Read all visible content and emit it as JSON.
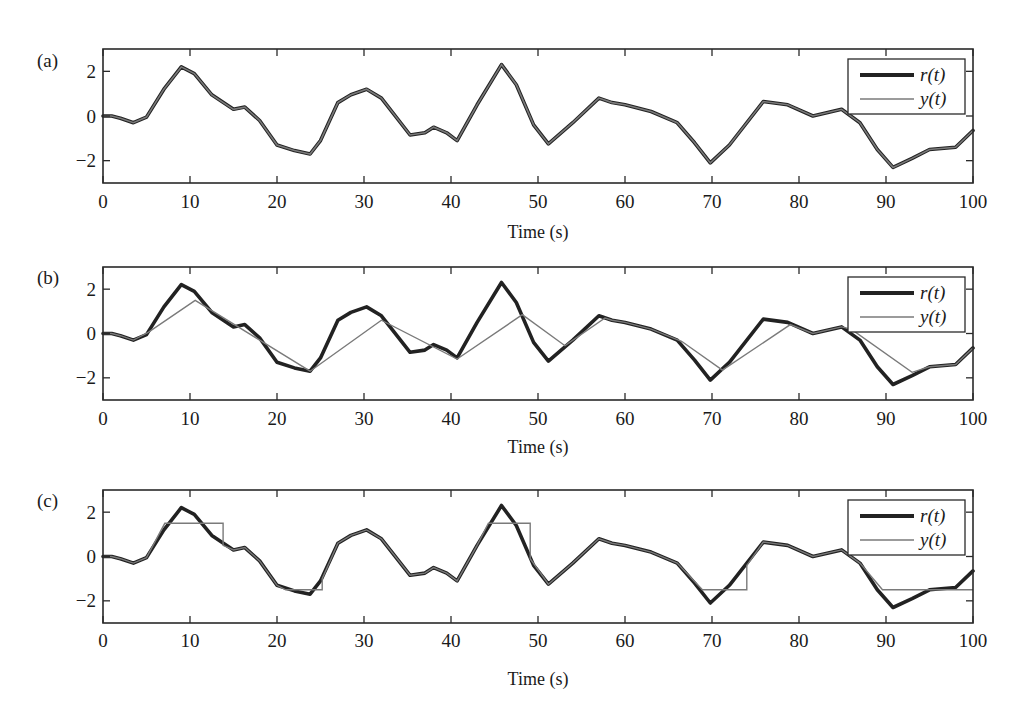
{
  "figure": {
    "background": "#ffffff",
    "axis_color": "#2a2a2a",
    "r_color": "#222222",
    "y_color": "#7a7a7a"
  },
  "chart_data": [
    {
      "type": "line",
      "panel_label": "(a)",
      "title": "",
      "xlabel": "Time (s)",
      "ylabel": "",
      "xlim": [
        0,
        100
      ],
      "ylim": [
        -3,
        3
      ],
      "xticks": [
        0,
        10,
        20,
        30,
        40,
        50,
        60,
        70,
        80,
        90,
        100
      ],
      "yticks": [
        2,
        0,
        -2
      ],
      "ytick_labels": [
        "2",
        "0",
        "−2"
      ],
      "grid": false,
      "legend": {
        "position": "upper right",
        "entries": [
          "r(t)",
          "y(t)"
        ]
      },
      "series": [
        {
          "name": "r(t)",
          "style": "thick dark",
          "x": [
            0,
            1,
            2,
            3.5,
            5,
            7,
            9,
            10.5,
            12.5,
            15,
            16.3,
            18,
            20,
            22,
            23.8,
            25,
            27,
            28.5,
            30.3,
            32,
            35.3,
            37,
            38,
            39.5,
            40.7,
            43,
            45.8,
            47.5,
            49.5,
            51.2,
            54,
            57,
            58.5,
            60,
            63,
            66,
            68,
            69.8,
            72,
            75.9,
            78.7,
            81.6,
            84.9,
            87,
            89,
            90.8,
            93,
            95,
            98,
            100
          ],
          "y": [
            0,
            0,
            -0.1,
            -0.3,
            -0.05,
            1.2,
            2.2,
            1.9,
            0.95,
            0.3,
            0.4,
            -0.2,
            -1.3,
            -1.55,
            -1.7,
            -1.1,
            0.6,
            0.95,
            1.2,
            0.8,
            -0.85,
            -0.75,
            -0.5,
            -0.75,
            -1.1,
            0.5,
            2.3,
            1.4,
            -0.4,
            -1.25,
            -0.3,
            0.8,
            0.6,
            0.5,
            0.2,
            -0.3,
            -1.2,
            -2.1,
            -1.3,
            0.65,
            0.5,
            0.0,
            0.3,
            -0.3,
            -1.5,
            -2.3,
            -1.9,
            -1.5,
            -1.4,
            -0.65
          ]
        },
        {
          "name": "y(t)",
          "style": "thin gray",
          "same_as": "r(t)"
        }
      ]
    },
    {
      "type": "line",
      "panel_label": "(b)",
      "title": "",
      "xlabel": "Time (s)",
      "ylabel": "",
      "xlim": [
        0,
        100
      ],
      "ylim": [
        -3,
        3
      ],
      "xticks": [
        0,
        10,
        20,
        30,
        40,
        50,
        60,
        70,
        80,
        90,
        100
      ],
      "yticks": [
        2,
        0,
        -2
      ],
      "ytick_labels": [
        "2",
        "0",
        "−2"
      ],
      "grid": false,
      "legend": {
        "position": "upper right",
        "entries": [
          "r(t)",
          "y(t)"
        ]
      },
      "series": [
        {
          "name": "r(t)",
          "style": "thick dark",
          "same_as_panel": "(a)"
        },
        {
          "name": "y(t)",
          "style": "thin gray (piecewise linear)",
          "x": [
            0,
            1,
            2,
            3.5,
            5.2,
            10.6,
            23.8,
            32,
            40.7,
            48.2,
            53.1,
            57.7,
            58.5,
            60,
            63,
            66.5,
            71.2,
            79,
            81.6,
            84.9,
            86,
            93,
            95,
            98,
            100
          ],
          "y": [
            0,
            0,
            -0.1,
            -0.3,
            0.05,
            1.5,
            -1.7,
            0.6,
            -1.15,
            0.85,
            -0.55,
            0.7,
            0.6,
            0.5,
            0.2,
            -0.35,
            -1.65,
            0.4,
            0.0,
            0.3,
            0.2,
            -1.75,
            -1.5,
            -1.4,
            -0.65
          ]
        }
      ]
    },
    {
      "type": "line",
      "panel_label": "(c)",
      "title": "",
      "xlabel": "Time (s)",
      "ylabel": "",
      "xlim": [
        0,
        100
      ],
      "ylim": [
        -3,
        3
      ],
      "xticks": [
        0,
        10,
        20,
        30,
        40,
        50,
        60,
        70,
        80,
        90,
        100
      ],
      "yticks": [
        2,
        0,
        -2
      ],
      "ytick_labels": [
        "2",
        "0",
        "−2"
      ],
      "grid": false,
      "legend": {
        "position": "upper right",
        "entries": [
          "r(t)",
          "y(t)"
        ]
      },
      "series": [
        {
          "name": "r(t)",
          "style": "thick dark",
          "same_as_panel": "(a)"
        },
        {
          "name": "y(t)",
          "style": "thin gray (saturated hold)",
          "x": [
            0,
            1,
            2,
            3.5,
            5,
            7.1,
            13.8,
            13.8,
            15,
            16.3,
            18,
            20,
            21,
            25.2,
            25.2,
            27,
            28.5,
            30.3,
            32,
            35.3,
            37,
            38,
            39.5,
            40.7,
            43,
            44.3,
            49.1,
            49.1,
            51.2,
            54,
            57,
            58.5,
            60,
            63,
            66,
            68.9,
            74,
            74,
            75.9,
            78.7,
            81.6,
            84.9,
            87,
            89.6,
            100
          ],
          "y": [
            0,
            0,
            -0.1,
            -0.3,
            -0.05,
            1.5,
            1.5,
            0.5,
            0.3,
            0.4,
            -0.2,
            -1.3,
            -1.5,
            -1.5,
            -1.0,
            0.6,
            0.95,
            1.2,
            0.8,
            -0.85,
            -0.75,
            -0.5,
            -0.75,
            -1.1,
            0.5,
            1.5,
            1.5,
            -0.1,
            -1.25,
            -0.3,
            0.8,
            0.6,
            0.5,
            0.2,
            -0.3,
            -1.5,
            -1.5,
            -0.4,
            0.65,
            0.5,
            0.0,
            0.3,
            -0.3,
            -1.5,
            -1.5
          ]
        }
      ]
    }
  ],
  "panels": [
    {
      "label": "(a)",
      "xlabel": "Time (s)",
      "legend_r": "r(t)",
      "legend_y": "y(t)"
    },
    {
      "label": "(b)",
      "xlabel": "Time (s)",
      "legend_r": "r(t)",
      "legend_y": "y(t)"
    },
    {
      "label": "(c)",
      "xlabel": "Time (s)",
      "legend_r": "r(t)",
      "legend_y": "y(t)"
    }
  ]
}
